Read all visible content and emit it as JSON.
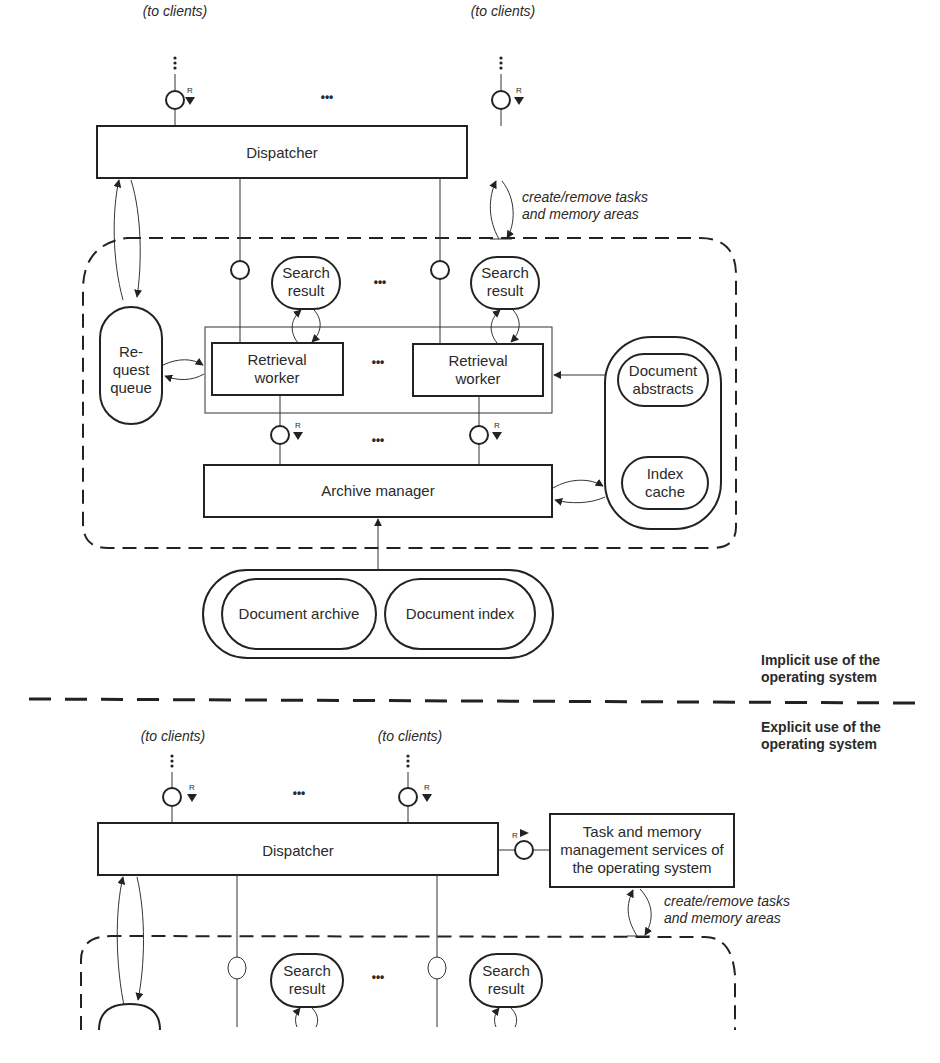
{
  "labels": {
    "to_clients": "(to clients)",
    "ellipsis": "•••",
    "port_r": "R",
    "dispatcher": "Dispatcher",
    "create_remove_line1": "create/remove tasks",
    "create_remove_line2": "and memory areas",
    "search_result_line1": "Search",
    "search_result_line2": "result",
    "retrieval_worker_line1": "Retrieval",
    "retrieval_worker_line2": "worker",
    "request_queue_line1": "Re-",
    "request_queue_line2": "quest",
    "request_queue_line3": "queue",
    "document_abstracts_line1": "Document",
    "document_abstracts_line2": "abstracts",
    "index_cache_line1": "Index",
    "index_cache_line2": "cache",
    "archive_manager": "Archive manager",
    "document_archive": "Document archive",
    "document_index": "Document index",
    "implicit_line1": "Implicit use of the",
    "implicit_line2": "operating system",
    "explicit_line1": "Explicit use of the",
    "explicit_line2": "operating system",
    "task_memory_line1": "Task and memory",
    "task_memory_line2": "management services of",
    "task_memory_line3": "the operating system"
  },
  "colors": {
    "stroke": "#222222",
    "text": "#2a2a2a",
    "background": "#ffffff"
  }
}
